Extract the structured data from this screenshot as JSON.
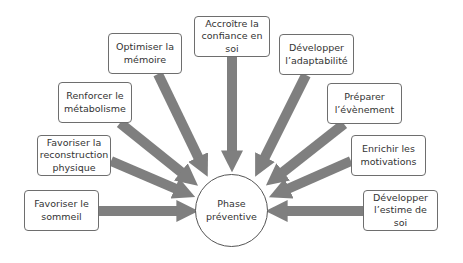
{
  "diagram": {
    "center": {
      "label": "Phase\npréventive"
    },
    "arrow_color": "#7f7f7f",
    "nodes": [
      {
        "id": "sommeil",
        "label": "Favoriser le\nsommeil"
      },
      {
        "id": "reconstruction",
        "label": "Favoriser la\nreconstruction\nphysique"
      },
      {
        "id": "metabolisme",
        "label": "Renforcer le\nmétabolisme"
      },
      {
        "id": "memoire",
        "label": "Optimiser la\nmémoire"
      },
      {
        "id": "confiance",
        "label": "Accroître la\nconfiance en\nsoi"
      },
      {
        "id": "adaptabilite",
        "label": "Développer\nl’adaptabilité"
      },
      {
        "id": "evenement",
        "label": "Préparer\nl’évènement"
      },
      {
        "id": "motivations",
        "label": "Enrichir les\nmotivations"
      },
      {
        "id": "estime",
        "label": "Développer\nl’estime de soi"
      }
    ]
  }
}
